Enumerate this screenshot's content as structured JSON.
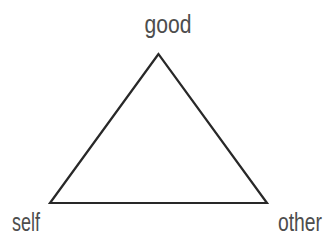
{
  "diagram": {
    "type": "triangle",
    "vertices": [
      {
        "position": "top",
        "label": "good"
      },
      {
        "position": "bottom-left",
        "label": "self"
      },
      {
        "position": "bottom-right",
        "label": "other"
      }
    ],
    "colors": {
      "line": "#282828",
      "text": "#4d4d4d",
      "background": "#ffffff"
    }
  }
}
